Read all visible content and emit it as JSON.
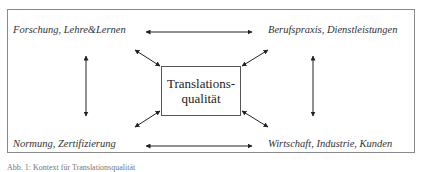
{
  "diagram": {
    "center": {
      "line1": "Translations-",
      "line2": "qualität"
    },
    "corners": {
      "top_left": "Forschung, Lehre&Lernen",
      "top_right": "Berufspraxis, Dienstleistungen",
      "bottom_left": "Normung, Zertifizierung",
      "bottom_right": "Wirtschaft, Industrie, Kunden"
    },
    "caption": "Abb. 1: Kontext für Translationsqualität"
  }
}
